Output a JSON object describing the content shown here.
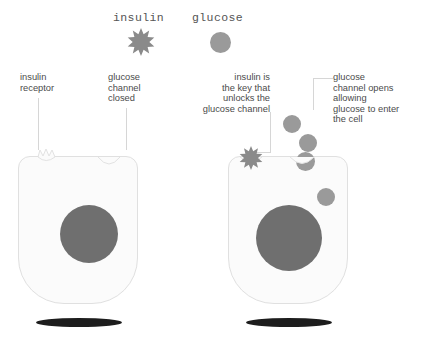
{
  "diagram": {
    "title_legend": [
      {
        "id": "insulin",
        "label": "insulin",
        "icon": "star-burst-icon"
      },
      {
        "id": "glucose",
        "label": "glucose",
        "icon": "circle-icon"
      }
    ],
    "panels": [
      {
        "id": "left-panel",
        "state": "no-insulin",
        "annotations": [
          {
            "id": "insulin-receptor",
            "text": "insulin\nreceptor",
            "align": "left"
          },
          {
            "id": "glucose-channel-closed",
            "text": "glucose\nchannel\nclosed",
            "align": "left"
          }
        ],
        "glucose_outside_count": 0,
        "glucose_inside_count": 0,
        "channel_open": false,
        "insulin_bound": false
      },
      {
        "id": "right-panel",
        "state": "insulin-bound",
        "annotations": [
          {
            "id": "insulin-is-the-key",
            "text": "insulin is\nthe key that\nunlocks the\nglucose channel",
            "align": "right"
          },
          {
            "id": "glucose-channel-opens",
            "text": "glucose\nchannel opens\nallowing\nglucose to enter\nthe cell",
            "align": "left"
          }
        ],
        "glucose_outside_count": 3,
        "glucose_inside_count": 1,
        "channel_open": true,
        "insulin_bound": true
      }
    ],
    "colors": {
      "glucose": "#9a9a9a",
      "nucleus": "#6f6f6f",
      "cell_fill": "#fbfbfb",
      "cell_outline": "#e0e0e0",
      "insulin": "#8a8a8a",
      "leader_line": "#d6d6d6",
      "shadow": "#1d1d1d",
      "text": "#4b4b4b",
      "background": "#ffffff"
    }
  }
}
